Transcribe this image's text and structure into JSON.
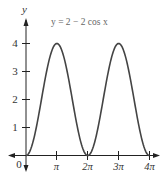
{
  "chart_data": {
    "type": "line",
    "title": "y = 2 − 2 cos x",
    "xlabel": "",
    "ylabel": "y",
    "x_tick_labels": [
      "0",
      "π",
      "2π",
      "3π",
      "4π"
    ],
    "y_tick_labels": [
      "1",
      "2",
      "3",
      "4"
    ],
    "xlim": [
      0,
      12.566
    ],
    "ylim": [
      0,
      4
    ],
    "grid": false,
    "series": [
      {
        "name": "y = 2 − 2 cos x",
        "x": [
          0,
          1.5708,
          3.1416,
          4.7124,
          6.2832,
          7.854,
          9.4248,
          10.9956,
          12.5664
        ],
        "values": [
          0,
          2,
          4,
          2,
          0,
          2,
          4,
          2,
          0
        ]
      }
    ]
  },
  "labels": {
    "y_axis": "y",
    "equation": "y = 2 − 2 cos x",
    "origin": "0",
    "x_ticks": [
      "π",
      "2π",
      "3π",
      "4π"
    ],
    "y_ticks": [
      "1",
      "2",
      "3",
      "4"
    ]
  },
  "colors": {
    "curve": "#444444",
    "axis": "#222222",
    "text": "#333333"
  }
}
